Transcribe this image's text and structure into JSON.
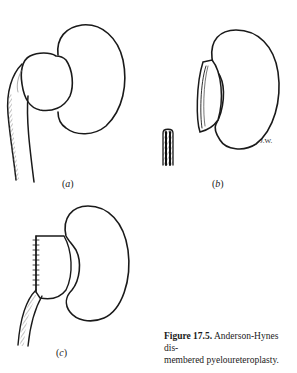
{
  "figure": {
    "number_label": "Figure 17.5.",
    "caption_text": "Anderson-Hynes dismembered pyeloureteroplasty.",
    "caption_line1": "Anderson-Hynes dis-",
    "caption_line2": "membered pyeloureteroplasty.",
    "artist_initials": "J.W."
  },
  "panels": [
    {
      "id": "a",
      "label_open": "(",
      "label_letter": "a",
      "label_close": ")",
      "depicts": "kidney with dilated renal pelvis and ureter"
    },
    {
      "id": "b",
      "label_open": "(",
      "label_letter": "b",
      "label_close": ")",
      "depicts": "kidney with pelvis excised and spatulated ureter stub"
    },
    {
      "id": "c",
      "label_open": "(",
      "label_letter": "c",
      "label_close": ")",
      "depicts": "kidney with sutured pelvis-ureter anastomosis"
    }
  ],
  "colors": {
    "line": "#1a1a1a",
    "hatch": "#555555",
    "background": "#ffffff"
  }
}
